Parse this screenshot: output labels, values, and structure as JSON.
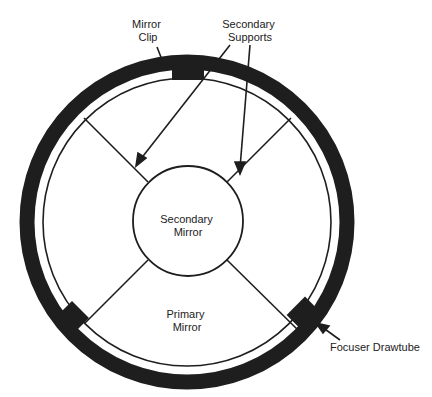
{
  "diagram": {
    "colors": {
      "ink": "#1e1e1e",
      "background": "#ffffff"
    },
    "labels": {
      "mirror_clip": [
        "Mirror",
        "Clip"
      ],
      "secondary_supports": [
        "Secondary",
        "Supports"
      ],
      "secondary_mirror": [
        "Secondary",
        "Mirror"
      ],
      "primary_mirror": [
        "Primary",
        "Mirror"
      ],
      "focuser_drawtube": "Focuser Drawtube"
    }
  }
}
